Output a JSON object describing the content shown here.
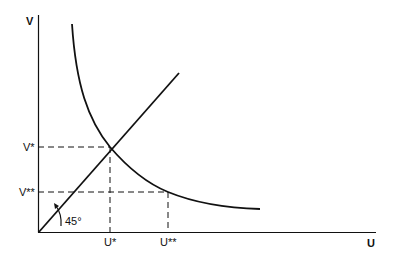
{
  "diagram": {
    "axes": {
      "y_label": "V",
      "x_label": "U"
    },
    "ticks": {
      "v_star": "V*",
      "v_double_star": "V**",
      "u_star": "U*",
      "u_double_star": "U**"
    },
    "angle_label": "45°",
    "elements": [
      "vertical axis V",
      "horizontal axis U",
      "45-degree line from origin",
      "downward-sloping convex curve",
      "dashed guide lines at (U*,V*) and (U**,V**)"
    ]
  }
}
